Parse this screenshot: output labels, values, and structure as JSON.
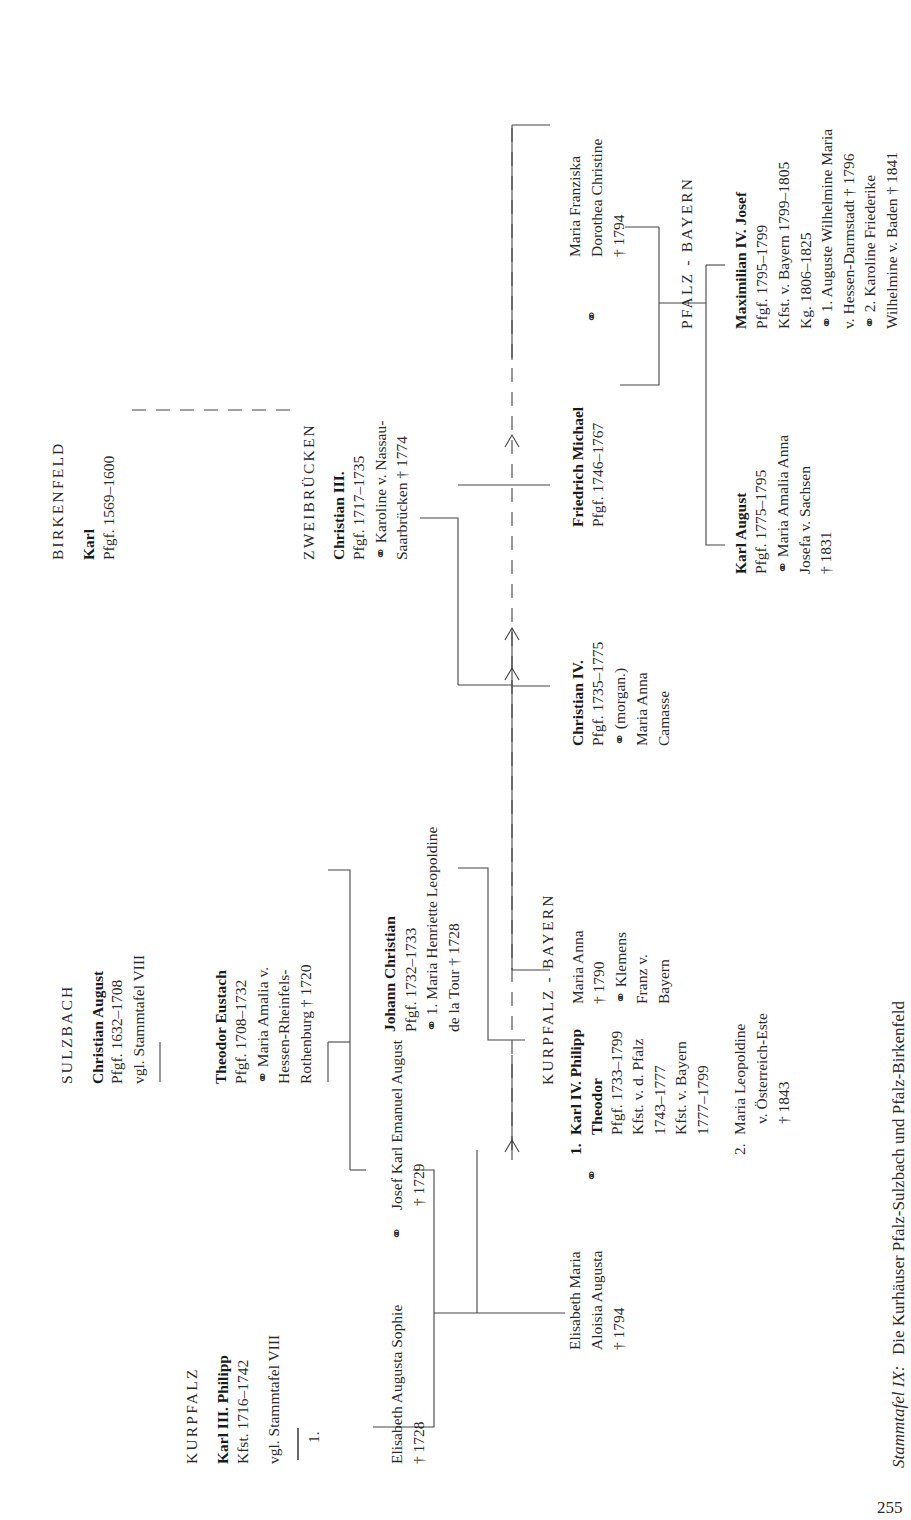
{
  "page": {
    "number": "255",
    "caption_label": "Stammtafel IX:",
    "caption_title": "Die Kurhäuser Pfalz-Sulzbach und Pfalz-Birkenfeld"
  },
  "houses": {
    "kurpfalz": "KURPFALZ",
    "sulzbach": "SULZBACH",
    "birkenfeld": "BIRKENFELD",
    "zweibruecken": "ZWEIBRÜCKEN",
    "kurpfalz_bayern": "KURPFALZ - BAYERN",
    "pfalz_bayern": "PFALZ - BAYERN"
  },
  "persons": {
    "karl3": {
      "name": "Karl III. Philipp",
      "lines": [
        "Kfst. 1716–1742",
        "vgl. Stammtafel VIII"
      ]
    },
    "christian_august": {
      "name": "Christian August",
      "lines": [
        "Pfgf. 1632–1708",
        "vgl. Stammtafel VIII"
      ]
    },
    "karl_birkenfeld": {
      "name": "Karl",
      "lines": [
        "Pfgf. 1569–1600"
      ]
    },
    "theodor_eustach": {
      "name": "Theodor Eustach",
      "lines": [
        "Pfgf. 1708–1732",
        "⚭ Maria Amalia v.",
        "Hessen-Rheinfels-",
        "Rothenburg † 1720"
      ]
    },
    "christian3": {
      "name": "Christian III.",
      "lines": [
        "Pfgf. 1717–1735",
        "⚭ Karoline v. Nassau-",
        "Saarbrücken † 1774"
      ]
    },
    "elisabeth_augusta_sophie": {
      "lines": [
        "Elisabeth Augusta Sophie",
        "† 1728"
      ]
    },
    "marriage_sign": "⚭",
    "josef_karl": {
      "lines": [
        "Josef Karl Emanuel August",
        "† 1729"
      ]
    },
    "johann_christian": {
      "name": "Johann Christian",
      "lines": [
        "Pfgf. 1732–1733",
        "⚭ 1. Maria Henriette Leopoldine",
        "de la Tour † 1728"
      ]
    },
    "first_marker": "1.",
    "elisabeth_maria": {
      "lines": [
        "Elisabeth Maria",
        "Aloisia Augusta",
        "† 1794"
      ]
    },
    "karl4": {
      "num": "1.",
      "name1": "Karl IV. Philipp",
      "name2": "Theodor",
      "lines": [
        "Pfgf. 1733–1799",
        "Kfst. v. d. Pfalz",
        "1743–1777",
        "Kfst. v. Bayern",
        "1777–1799"
      ]
    },
    "maria_leopoldine": {
      "num": "2.",
      "lines": [
        "Maria Leopoldine",
        "v. Österreich-Este",
        "† 1843"
      ]
    },
    "maria_anna": {
      "lines": [
        "Maria Anna",
        "† 1790",
        "⚭ Klemens",
        "Franz v.",
        "Bayern"
      ]
    },
    "christian4": {
      "name": "Christian IV.",
      "lines": [
        "Pfgf. 1735–1775",
        "⚭ (morgan.)",
        "Maria Anna",
        "Camasse"
      ]
    },
    "friedrich_michael": {
      "name": "Friedrich Michael",
      "lines": [
        "Pfgf. 1746–1767"
      ]
    },
    "maria_franziska": {
      "lines": [
        "Maria Franziska",
        "Dorothea Christine",
        "† 1794"
      ]
    },
    "karl_august": {
      "name": "Karl August",
      "lines": [
        "Pfgf. 1775–1795",
        "⚭ Maria Amalia Anna",
        "Josefa v. Sachsen",
        "† 1831"
      ]
    },
    "maximilian": {
      "name": "Maximilian IV. Josef",
      "lines": [
        "Pfgf. 1795–1799",
        "Kfst. v. Bayern 1799–1805",
        "Kg. 1806–1825",
        "⚭ 1. Auguste Wilhelmine Maria",
        "v. Hessen-Darmstadt † 1796",
        "⚭ 2. Karoline Friederike",
        "Wilhelmine v. Baden † 1841"
      ]
    }
  }
}
